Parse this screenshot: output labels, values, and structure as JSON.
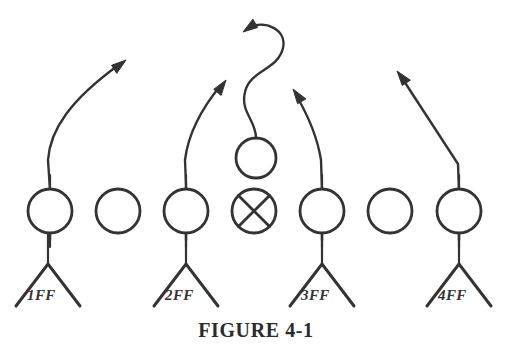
{
  "figure": {
    "caption": "FIGURE 4-1",
    "caption_x": 256,
    "caption_y": 337,
    "background_color": "#ffffff",
    "ink_color": "#333333"
  },
  "chart_data": {
    "type": "diagram",
    "title": "FIGURE 4-1",
    "subtitle": "",
    "diagram_kind": "football-play-formation",
    "xlabel": "",
    "ylabel": "",
    "grid": false,
    "legend": "none",
    "xlim": [
      0,
      508
    ],
    "ylim": [
      0,
      350
    ],
    "linemen": [
      {
        "id": "lineman-1",
        "cx": 50,
        "cy": 211,
        "r": 22,
        "mark": "none",
        "has_stem": true
      },
      {
        "id": "lineman-2",
        "cx": 118,
        "cy": 211,
        "r": 22,
        "mark": "none",
        "has_stem": false
      },
      {
        "id": "lineman-3",
        "cx": 186,
        "cy": 211,
        "r": 22,
        "mark": "none",
        "has_stem": true
      },
      {
        "id": "center",
        "cx": 254,
        "cy": 211,
        "r": 22,
        "mark": "x",
        "has_stem": false
      },
      {
        "id": "lineman-5",
        "cx": 322,
        "cy": 211,
        "r": 22,
        "mark": "none",
        "has_stem": true
      },
      {
        "id": "lineman-6",
        "cx": 390,
        "cy": 211,
        "r": 22,
        "mark": "none",
        "has_stem": false
      },
      {
        "id": "lineman-7",
        "cx": 459,
        "cy": 211,
        "r": 22,
        "mark": "none",
        "has_stem": true
      }
    ],
    "quarterback": {
      "id": "quarterback",
      "cx": 256,
      "cy": 158,
      "r": 20
    },
    "backs": [
      {
        "id": "back-1",
        "label": "1FF",
        "apex_x": 48,
        "apex_y": 264,
        "label_x": 27,
        "label_y": 300
      },
      {
        "id": "back-2",
        "label": "2FF",
        "apex_x": 186,
        "apex_y": 264,
        "label_x": 165,
        "label_y": 300
      },
      {
        "id": "back-3",
        "label": "3FF",
        "apex_x": 322,
        "apex_y": 264,
        "label_x": 301,
        "label_y": 300
      },
      {
        "id": "back-4",
        "label": "4FF",
        "apex_x": 459,
        "apex_y": 264,
        "label_x": 438,
        "label_y": 300
      }
    ],
    "routes": [
      {
        "id": "route-1",
        "from_back": "1FF",
        "description": "straight upfield then bending right to a deep out-and-up",
        "path": "M 50 240 L 50 190 L 48 160 C 50 130 70 100 120 64",
        "arrow_tip": [
          126,
          60
        ],
        "arrow_angle_deg": -33
      },
      {
        "id": "route-2",
        "from_back": "2FF",
        "description": "straight upfield with slight rightward bend",
        "path": "M 186 240 L 186 185 L 185 160 C 188 135 202 108 221 85",
        "arrow_tip": [
          226,
          80
        ],
        "arrow_angle_deg": -50
      },
      {
        "id": "route-3",
        "from_back": "3FF",
        "description": "straight upfield then slight leftward bend",
        "path": "M 322 240 L 322 190 L 321 160 C 317 135 306 112 296 95",
        "arrow_tip": [
          293,
          89
        ],
        "arrow_angle_deg": -120
      },
      {
        "id": "route-4",
        "from_back": "4FF",
        "description": "straight upfield then sharp diagonal to the upper left",
        "path": "M 459 240 L 459 190 L 458 164 L 402 78",
        "arrow_tip": [
          397,
          71
        ],
        "arrow_angle_deg": -123
      },
      {
        "id": "route-quarterback",
        "from_back": "quarterback",
        "description": "S-curve drop rising from the quarterback then hooking back to the left",
        "path": "M 256 138 C 256 120 240 112 245 92 C 250 70 278 70 283 48 C 287 30 266 20 250 27",
        "arrow_tip": [
          243,
          32
        ],
        "arrow_angle_deg": 150
      }
    ]
  }
}
